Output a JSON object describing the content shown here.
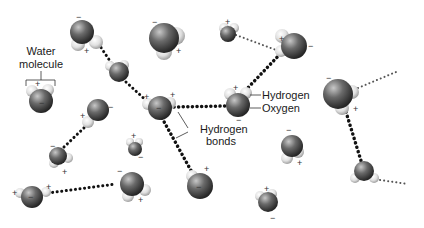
{
  "labels": {
    "water_molecule_line1": "Water",
    "water_molecule_line2": "molecule",
    "hydrogen": "Hydrogen",
    "oxygen": "Oxygen",
    "hydrogen_bonds_line1": "Hydrogen",
    "hydrogen_bonds_line2": "bonds"
  },
  "charges": {
    "positive": "+",
    "negative": "−"
  },
  "colors": {
    "oxygen_dark": "#2e2e2e",
    "oxygen_light": "#b8b8b8",
    "hydrogen_light": "#f2f2f2",
    "hydrogen_dark": "#a8a8a8",
    "bond": "#111111",
    "text": "#1a1a1a"
  }
}
